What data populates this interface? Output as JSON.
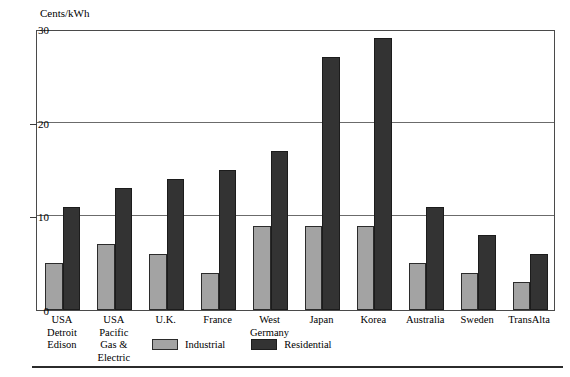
{
  "chart_data": {
    "type": "bar",
    "title": "",
    "ylabel": "Cents/kWh",
    "xlabel": "",
    "ylim": [
      0,
      30
    ],
    "yticks": [
      0,
      10,
      20,
      30
    ],
    "grid": true,
    "legend_position": "bottom-center",
    "categories": [
      "USA Detroit Edison",
      "USA Pacific Gas & Electric",
      "U.K.",
      "France",
      "West Germany",
      "Japan",
      "Korea",
      "Australia",
      "Sweden",
      "TransAlta"
    ],
    "category_label_lines": [
      [
        "USA",
        "Detroit",
        "Edison"
      ],
      [
        "USA",
        "Pacific",
        "Gas &",
        "Electric"
      ],
      [
        "U.K."
      ],
      [
        "France"
      ],
      [
        "West",
        "Germany"
      ],
      [
        "Japan"
      ],
      [
        "Korea"
      ],
      [
        "Australia"
      ],
      [
        "Sweden"
      ],
      [
        "TransAlta"
      ]
    ],
    "series": [
      {
        "name": "Industrial",
        "color": "#a3a3a3",
        "values": [
          5,
          7,
          6,
          4,
          9,
          9,
          9,
          5,
          4,
          3
        ]
      },
      {
        "name": "Residential",
        "color": "#333333",
        "values": [
          11,
          13,
          14,
          15,
          17,
          27,
          29,
          11,
          8,
          6
        ]
      }
    ]
  },
  "legend": {
    "items": [
      {
        "label": "Industrial",
        "color": "#a3a3a3"
      },
      {
        "label": "Residential",
        "color": "#333333"
      }
    ]
  },
  "axis": {
    "y_title": "Cents/kWh",
    "y_tick_labels": [
      "0",
      "10",
      "20",
      "30"
    ]
  }
}
